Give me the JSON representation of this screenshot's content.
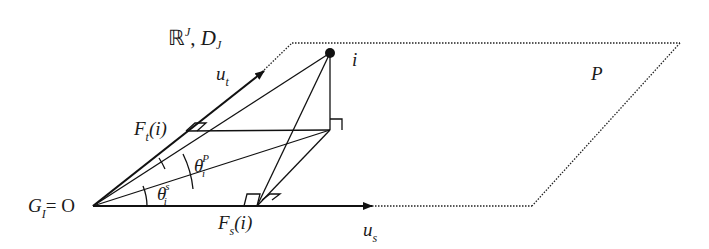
{
  "diagram": {
    "space_label": "ℝ",
    "space_sup": "J",
    "space_sep": ", ",
    "space_D": "D",
    "space_D_sub": "J",
    "point_label": "i",
    "plane_label": "P",
    "u_t": {
      "base": "u",
      "sub": "t"
    },
    "u_s": {
      "base": "u",
      "sub": "s"
    },
    "F_t": {
      "base": "F",
      "sub": "t",
      "arg": "(i)"
    },
    "F_s": {
      "base": "F",
      "sub": "s",
      "arg": "(i)"
    },
    "theta_P": {
      "base": "θ",
      "sub": "i",
      "sup": "P"
    },
    "theta_s": {
      "base": "θ",
      "sub": "i",
      "sup": "s"
    },
    "origin": {
      "base": "G",
      "sub": "I",
      "eq": "= O"
    }
  }
}
